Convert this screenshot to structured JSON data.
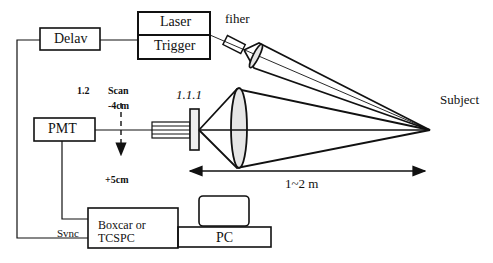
{
  "diagram": {
    "boxes": {
      "delay": "Delav",
      "laser": "Laser",
      "trigger": "Trigger",
      "pmt": "PMT",
      "boxcar_line1": "Boxcar or",
      "boxcar_line2": "TCSPC",
      "pc": "PC"
    },
    "labels": {
      "fiber": "fiher",
      "subject": "Subject",
      "section_number": "1.2",
      "scan": "Scan",
      "scan_start": "-4cm",
      "scan_end": "+5cm",
      "figure_label": "1.1.1",
      "distance": "1~2 m",
      "sync": "Svnc"
    },
    "colors": {
      "stroke": "#111111",
      "lens_fill": "#e6e6e6",
      "background": "#ffffff"
    }
  }
}
